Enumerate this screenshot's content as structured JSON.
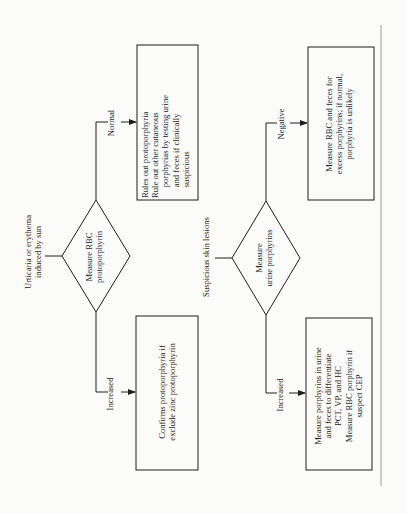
{
  "orientation": "rotated-90-ccw",
  "flowcharts": [
    {
      "input": "Urticaria or erythema\ninduced by sun",
      "decision": "Measure RBC\nprotoporphyrin",
      "branches": [
        {
          "label": "Normal",
          "result": "Rules out protoporphyria\nRule out other cutaneous\n     porphyrias by testing urine\n     and feces if clinically\n     suspicious"
        },
        {
          "label": "Increased",
          "result": "Confirms protoporphyria if\nexclude zinc protoporphyrin"
        }
      ]
    },
    {
      "input": "Suspicious skin lesions",
      "decision": "Measure\nurine porphyrins",
      "branches": [
        {
          "label": "Negative",
          "result": "Measure RBC and feces for\nexcess porphyrins; if normal,\nporphyria is unlikely"
        },
        {
          "label": "Increased",
          "result": "Measure porphyrins in urine\nand feces to differentiate\nPCT, VP, and HC\nMeasure RBC porphyrin if\nsuspect CEP"
        }
      ]
    }
  ]
}
